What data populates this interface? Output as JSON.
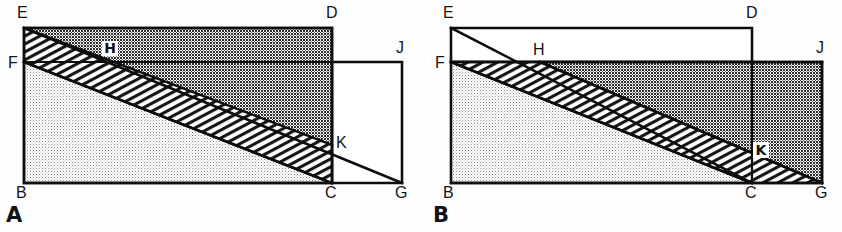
{
  "figure": {
    "caption_tags": [
      "A",
      "B"
    ],
    "background_color": "#fdfdfd",
    "line_color": "#0d0d0d"
  },
  "fills": {
    "dark_stipple": "#4a4a4a",
    "light_stipple": "#d8d8d8",
    "diagonal_hatch": "#ffffff",
    "plain_white": "#ffffff"
  },
  "panels": [
    {
      "id": "A",
      "tag": "A",
      "vertices": [
        {
          "name": "E",
          "label": "E",
          "x": 24,
          "y": 28,
          "label_x": 17,
          "label_y": 18,
          "boxed": false
        },
        {
          "name": "D",
          "label": "D",
          "x": 332,
          "y": 28,
          "label_x": 326,
          "label_y": 18,
          "boxed": false
        },
        {
          "name": "F",
          "label": "F",
          "x": 24,
          "y": 62,
          "label_x": 10,
          "label_y": 66,
          "boxed": false
        },
        {
          "name": "J",
          "label": "J",
          "x": 402,
          "y": 62,
          "label_x": 396,
          "label_y": 52,
          "boxed": false
        },
        {
          "name": "H",
          "label": "H",
          "x": 110,
          "y": 52,
          "label_x": 108,
          "label_y": 52,
          "boxed": true
        },
        {
          "name": "K",
          "label": "K",
          "x": 332,
          "y": 145,
          "label_x": 337,
          "label_y": 146,
          "boxed": false
        },
        {
          "name": "B",
          "label": "B",
          "x": 24,
          "y": 183,
          "label_x": 16,
          "label_y": 196,
          "boxed": false
        },
        {
          "name": "C",
          "label": "C",
          "x": 332,
          "y": 183,
          "label_x": 326,
          "label_y": 196,
          "boxed": false
        },
        {
          "name": "G",
          "label": "G",
          "x": 402,
          "y": 183,
          "label_x": 396,
          "label_y": 196,
          "boxed": false
        }
      ],
      "regions": [
        {
          "name": "dark-stipple-region",
          "fill": "dark_stipple",
          "points": "24,28 332,28 332,145 "
        },
        {
          "name": "light-stipple-region",
          "fill": "light_stipple",
          "points": "24,62 332,183 24,183"
        },
        {
          "name": "diagonal-hatch-band",
          "fill": "diagonal_hatch",
          "points": "24,28 24,62 332,183 332,145"
        },
        {
          "name": "plain-white-region",
          "fill": "plain_white",
          "points": "332,62 402,62 402,183 332,183"
        }
      ]
    },
    {
      "id": "B",
      "tag": "B",
      "vertices": [
        {
          "name": "E",
          "label": "E",
          "x": 451,
          "y": 28,
          "label_x": 444,
          "label_y": 18,
          "boxed": false
        },
        {
          "name": "D",
          "label": "D",
          "x": 752,
          "y": 28,
          "label_x": 746,
          "label_y": 18,
          "boxed": false
        },
        {
          "name": "F",
          "label": "F",
          "x": 451,
          "y": 62,
          "label_x": 437,
          "label_y": 66,
          "boxed": false
        },
        {
          "name": "J",
          "label": "J",
          "x": 822,
          "y": 62,
          "label_x": 816,
          "label_y": 52,
          "boxed": false
        },
        {
          "name": "H",
          "label": "H",
          "x": 540,
          "y": 62,
          "label_x": 534,
          "label_y": 54,
          "boxed": false
        },
        {
          "name": "K",
          "label": "K",
          "x": 752,
          "y": 153,
          "label_x": 757,
          "label_y": 154,
          "boxed": true
        },
        {
          "name": "B",
          "label": "B",
          "x": 451,
          "y": 183,
          "label_x": 443,
          "label_y": 196,
          "boxed": false
        },
        {
          "name": "C",
          "label": "C",
          "x": 752,
          "y": 183,
          "label_x": 746,
          "label_y": 196,
          "boxed": false
        },
        {
          "name": "G",
          "label": "G",
          "x": 822,
          "y": 183,
          "label_x": 816,
          "label_y": 196,
          "boxed": false
        }
      ],
      "regions": [
        {
          "name": "dark-stipple-region",
          "fill": "dark_stipple",
          "points": "540,62 822,62 822,183 "
        },
        {
          "name": "light-stipple-region",
          "fill": "light_stipple",
          "points": "451,62 752,183 451,183"
        },
        {
          "name": "diagonal-hatch-band",
          "fill": "diagonal_hatch",
          "points": "451,62 540,62 822,183 752,183"
        },
        {
          "name": "plain-white-region",
          "fill": "plain_white",
          "points": "451,28 752,28 752,62 451,62"
        }
      ]
    }
  ]
}
